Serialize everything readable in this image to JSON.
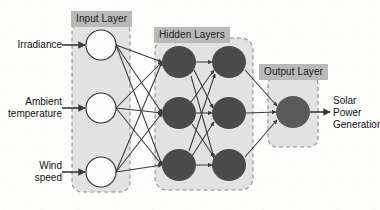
{
  "diagram": {
    "type": "neural-network",
    "background_color": "#fdfdfc",
    "panel_fill": "#e2e2e2",
    "panel_border_color": "#8f8f8f",
    "label_band_color": "#b9b9b9",
    "edge_color": "#3a3a3a",
    "input_node_fill": "#fbfbfb",
    "input_node_stroke": "#2b2b2b",
    "hidden_node_fill": "#4a4a4a",
    "output_node_fill": "#5a5a5a"
  },
  "panels": [
    {
      "id": "input",
      "label": "Input Layer",
      "x": 72,
      "y": 22,
      "w": 58,
      "h": 170
    },
    {
      "id": "hidden",
      "label": "Hidden Layers",
      "x": 155,
      "y": 38,
      "w": 98,
      "h": 152
    },
    {
      "id": "output",
      "label": "Output Layer",
      "x": 268,
      "y": 75,
      "w": 50,
      "h": 72
    }
  ],
  "panel_labels": [
    {
      "id": "input-layer-label",
      "text": "Input Layer",
      "x": 71,
      "y": 11
    },
    {
      "id": "hidden-layers-label",
      "text": "Hidden Layers",
      "x": 154,
      "y": 27
    },
    {
      "id": "output-layer-label",
      "text": "Output Layer",
      "x": 259,
      "y": 64
    }
  ],
  "inputs": [
    {
      "id": "irradiance",
      "label": "Irradiance",
      "lines": [
        "Irradiance"
      ],
      "cx": 101,
      "cy": 45,
      "r": 15
    },
    {
      "id": "ambient-temperature",
      "label": "Ambient temperature",
      "lines": [
        "Ambient",
        "temperature"
      ],
      "cx": 101,
      "cy": 108,
      "r": 15
    },
    {
      "id": "wind-speed",
      "label": "Wind speed",
      "lines": [
        "Wind",
        "speed"
      ],
      "cx": 101,
      "cy": 172,
      "r": 15
    }
  ],
  "hidden_nodes": [
    {
      "id": "h1-1",
      "column": 1,
      "cx": 179,
      "cy": 62,
      "rx": 17,
      "ry": 16
    },
    {
      "id": "h1-2",
      "column": 1,
      "cx": 179,
      "cy": 113,
      "rx": 17,
      "ry": 16
    },
    {
      "id": "h1-3",
      "column": 1,
      "cx": 179,
      "cy": 165,
      "rx": 17,
      "ry": 16
    },
    {
      "id": "h2-1",
      "column": 2,
      "cx": 229,
      "cy": 62,
      "rx": 17,
      "ry": 16
    },
    {
      "id": "h2-2",
      "column": 2,
      "cx": 229,
      "cy": 113,
      "rx": 17,
      "ry": 16
    },
    {
      "id": "h2-3",
      "column": 2,
      "cx": 229,
      "cy": 165,
      "rx": 17,
      "ry": 16
    }
  ],
  "output_node": {
    "id": "output-node",
    "cx": 293,
    "cy": 112,
    "rx": 17,
    "ry": 16
  },
  "output": {
    "id": "solar-power-generation",
    "label": "Solar Power Generation",
    "lines": [
      "Solar",
      "Power",
      "Generation"
    ],
    "x": 322,
    "y": 96
  },
  "input_label_positions": [
    {
      "id": "irradiance-label",
      "x": 2,
      "y": 39,
      "w": 62
    },
    {
      "id": "ambient-temperature-label",
      "x": 2,
      "y": 96,
      "w": 62
    },
    {
      "id": "wind-speed-label",
      "x": 2,
      "y": 160,
      "w": 62
    }
  ],
  "connections": {
    "input_to_hidden1": "fully-connected",
    "hidden1_to_hidden2": "fully-connected",
    "hidden2_to_output": "fully-connected",
    "arrowheads": true
  }
}
